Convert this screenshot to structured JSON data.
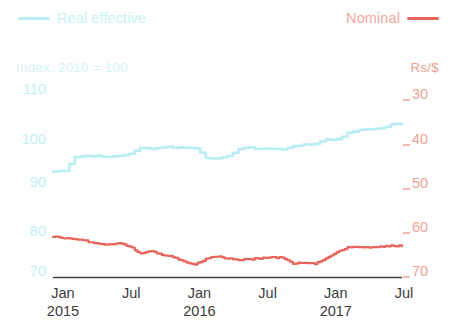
{
  "legend": {
    "real": {
      "label": "Real effective",
      "color": "#b8eef3",
      "swatch": "line-swatch"
    },
    "nominal": {
      "label": "Nominal",
      "color": "#e8635a",
      "swatch": "line-swatch"
    }
  },
  "axes": {
    "left_title": "Index, 2010 = 100",
    "right_title": "Rs/$",
    "left_ticks": [
      "110",
      "100",
      "90",
      "80",
      "70"
    ],
    "right_ticks": [
      "30",
      "40",
      "50",
      "60",
      "70"
    ],
    "x_ticks": [
      {
        "month": "Jan",
        "year": "2015"
      },
      {
        "month": "Jul",
        "year": ""
      },
      {
        "month": "Jan",
        "year": "2016"
      },
      {
        "month": "Jul",
        "year": ""
      },
      {
        "month": "Jan",
        "year": "2017"
      },
      {
        "month": "Jul",
        "year": ""
      }
    ]
  },
  "chart_data": {
    "type": "line",
    "title": "",
    "xlabel": "",
    "grid": false,
    "legend_position": "top",
    "x_start": "2015-01",
    "x_end": "2017-09",
    "x_tick_labels": [
      "Jan 2015",
      "Jul",
      "Jan 2016",
      "Jul",
      "Jan 2017",
      "Jul"
    ],
    "axis_left": {
      "label": "Index, 2010 = 100",
      "ticks": [
        110,
        100,
        90,
        80,
        70
      ],
      "ylim": [
        68,
        112
      ],
      "inverted": false,
      "color": "#b8eef3"
    },
    "axis_right": {
      "label": "Rs/$",
      "ticks": [
        30,
        40,
        50,
        60,
        70
      ],
      "ylim": [
        27,
        73
      ],
      "inverted": true,
      "color": "#e8635a"
    },
    "series": [
      {
        "name": "Real effective",
        "axis": "left",
        "color": "#b8eef3",
        "unit": "Index, 2010 = 100",
        "x": [
          "2015-01",
          "2015-02",
          "2015-03",
          "2015-04",
          "2015-05",
          "2015-06",
          "2015-07",
          "2015-08",
          "2015-09",
          "2015-10",
          "2015-11",
          "2015-12",
          "2016-01",
          "2016-02",
          "2016-03",
          "2016-04",
          "2016-05",
          "2016-06",
          "2016-07",
          "2016-08",
          "2016-09",
          "2016-10",
          "2016-11",
          "2016-12",
          "2017-01",
          "2017-02",
          "2017-03",
          "2017-04",
          "2017-05",
          "2017-06",
          "2017-07",
          "2017-08",
          "2017-09"
        ],
        "values": [
          92.0,
          92.2,
          95.3,
          95.6,
          95.5,
          95.3,
          95.4,
          96.0,
          97.2,
          97.1,
          97.5,
          97.3,
          97.4,
          97.2,
          95.1,
          94.9,
          95.6,
          97.1,
          97.4,
          97.0,
          97.1,
          96.9,
          97.6,
          98.0,
          98.2,
          99.2,
          99.1,
          100.5,
          101.2,
          101.3,
          101.6,
          102.4,
          102.5
        ]
      },
      {
        "name": "Nominal",
        "axis": "right",
        "color": "#e8635a",
        "unit": "Rs/$",
        "x": [
          "2015-01",
          "2015-02",
          "2015-03",
          "2015-04",
          "2015-05",
          "2015-06",
          "2015-07",
          "2015-08",
          "2015-09",
          "2015-10",
          "2015-11",
          "2015-12",
          "2016-01",
          "2016-02",
          "2016-03",
          "2016-04",
          "2016-05",
          "2016-06",
          "2016-07",
          "2016-08",
          "2016-09",
          "2016-10",
          "2016-11",
          "2016-12",
          "2017-01",
          "2017-02",
          "2017-03",
          "2017-04",
          "2017-05",
          "2017-06",
          "2017-07",
          "2017-08",
          "2017-09"
        ],
        "values": [
          62.0,
          62.3,
          62.5,
          63.0,
          63.6,
          63.8,
          63.6,
          64.2,
          65.8,
          65.2,
          66.2,
          66.6,
          67.6,
          68.3,
          67.0,
          66.5,
          66.9,
          67.2,
          67.1,
          66.9,
          66.7,
          66.8,
          68.1,
          67.9,
          68.1,
          67.0,
          65.5,
          64.5,
          64.4,
          64.5,
          64.3,
          64.0,
          64.2
        ]
      }
    ]
  }
}
